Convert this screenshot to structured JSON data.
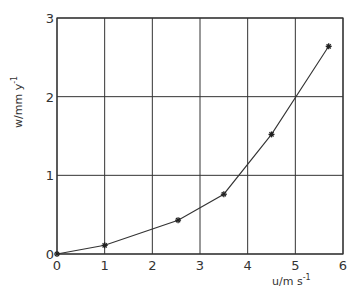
{
  "chart_data": {
    "type": "line",
    "title": "",
    "xlabel": "u/m s",
    "xlabel_superscript": "-1",
    "ylabel": "w/mm y",
    "ylabel_superscript": "-1",
    "xlim": [
      0,
      6
    ],
    "ylim": [
      0,
      3
    ],
    "x_ticks": [
      "0",
      "1",
      "2",
      "3",
      "4",
      "5",
      "6"
    ],
    "y_ticks": [
      "0",
      "1",
      "2",
      "3"
    ],
    "grid": true,
    "legend": null,
    "marker": "asterisk",
    "series": [
      {
        "name": "w vs u",
        "x": [
          0,
          1.0,
          2.54,
          3.5,
          4.5,
          5.7
        ],
        "y": [
          0,
          0.11,
          0.43,
          0.76,
          1.52,
          2.64
        ]
      }
    ]
  },
  "colors": {
    "line": "#333333",
    "grid": "#333333",
    "background": "#ffffff"
  }
}
